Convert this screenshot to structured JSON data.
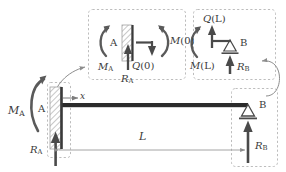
{
  "figure": {
    "type": "engineering-free-body-diagram",
    "width": 286,
    "height": 172,
    "colors": {
      "background": "#ffffff",
      "beam": "#2b2b2b",
      "arrow": "#4a4a4a",
      "dashed_box": "#b9b9b9",
      "dimension_line": "#9a9a9a",
      "hatch": "#8a8a8a",
      "text": "#3a3a3a"
    }
  },
  "beam": {
    "label_A": "A",
    "label_B": "B",
    "axis_label": "x",
    "span_label": "L",
    "moment_A": {
      "symbol": "M",
      "sub": "A"
    },
    "reaction_A": {
      "symbol": "R",
      "sub": "A"
    },
    "reaction_B": {
      "symbol": "R",
      "sub": "B"
    },
    "support_A_type": "fixed-hatched-wall",
    "support_B_type": "roller-triangle"
  },
  "detail_left": {
    "name": "left-cut-free-body",
    "label_A": "A",
    "moment_A": {
      "symbol": "M",
      "sub": "A"
    },
    "reaction_A": {
      "symbol": "R",
      "sub": "A"
    },
    "shear_0": {
      "symbol": "Q",
      "arg": "(0)"
    },
    "moment_0": {
      "symbol": "M",
      "arg": "(0)"
    }
  },
  "detail_right": {
    "name": "right-cut-free-body",
    "label_B": "B",
    "shear_L": {
      "symbol": "Q",
      "arg": "(L)"
    },
    "moment_L": {
      "symbol": "M",
      "arg": "(L)"
    },
    "reaction_B": {
      "symbol": "R",
      "sub": "B"
    }
  }
}
